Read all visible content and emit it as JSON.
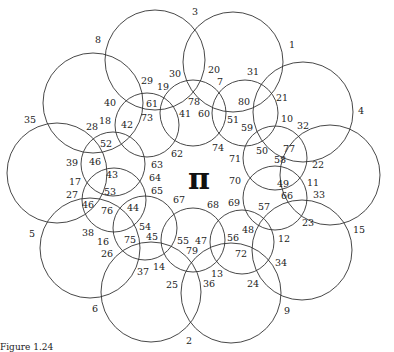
{
  "center_symbol": "π",
  "caption": "Figure 1.24",
  "outer_circles": [
    {
      "cx": 155,
      "cy": 60,
      "r": 50
    },
    {
      "cx": 233,
      "cy": 62,
      "r": 50
    },
    {
      "cx": 303,
      "cy": 112,
      "r": 50
    },
    {
      "cx": 330,
      "cy": 175,
      "r": 50
    },
    {
      "cx": 302,
      "cy": 250,
      "r": 50
    },
    {
      "cx": 231,
      "cy": 293,
      "r": 50
    },
    {
      "cx": 151,
      "cy": 292,
      "r": 50
    },
    {
      "cx": 90,
      "cy": 248,
      "r": 50
    },
    {
      "cx": 57,
      "cy": 173,
      "r": 50
    },
    {
      "cx": 93,
      "cy": 103,
      "r": 50
    }
  ],
  "inner_circles": [
    {
      "cx": 147,
      "cy": 125,
      "r": 32
    },
    {
      "cx": 193,
      "cy": 113,
      "r": 33
    },
    {
      "cx": 245,
      "cy": 113,
      "r": 33
    },
    {
      "cx": 275,
      "cy": 158,
      "r": 32
    },
    {
      "cx": 275,
      "cy": 198,
      "r": 32
    },
    {
      "cx": 242,
      "cy": 242,
      "r": 32
    },
    {
      "cx": 193,
      "cy": 240,
      "r": 32
    },
    {
      "cx": 145,
      "cy": 228,
      "r": 32
    },
    {
      "cx": 114,
      "cy": 200,
      "r": 32
    },
    {
      "cx": 113,
      "cy": 164,
      "r": 32
    }
  ],
  "labels": [
    {
      "t": "3",
      "x": 195,
      "y": 11
    },
    {
      "t": "1",
      "x": 292,
      "y": 44
    },
    {
      "t": "8",
      "x": 98,
      "y": 39
    },
    {
      "t": "4",
      "x": 361,
      "y": 110
    },
    {
      "t": "35",
      "x": 30,
      "y": 119
    },
    {
      "t": "15",
      "x": 359,
      "y": 229
    },
    {
      "t": "5",
      "x": 32,
      "y": 233
    },
    {
      "t": "6",
      "x": 95,
      "y": 308
    },
    {
      "t": "2",
      "x": 189,
      "y": 340
    },
    {
      "t": "9",
      "x": 287,
      "y": 310
    },
    {
      "t": "30",
      "x": 175,
      "y": 73
    },
    {
      "t": "20",
      "x": 214,
      "y": 69
    },
    {
      "t": "7",
      "x": 220,
      "y": 81
    },
    {
      "t": "31",
      "x": 253,
      "y": 71
    },
    {
      "t": "29",
      "x": 147,
      "y": 80
    },
    {
      "t": "19",
      "x": 163,
      "y": 86
    },
    {
      "t": "21",
      "x": 282,
      "y": 97
    },
    {
      "t": "40",
      "x": 110,
      "y": 102
    },
    {
      "t": "61",
      "x": 152,
      "y": 103
    },
    {
      "t": "78",
      "x": 194,
      "y": 101
    },
    {
      "t": "80",
      "x": 244,
      "y": 101
    },
    {
      "t": "73",
      "x": 147,
      "y": 117
    },
    {
      "t": "41",
      "x": 185,
      "y": 113
    },
    {
      "t": "60",
      "x": 204,
      "y": 113
    },
    {
      "t": "51",
      "x": 233,
      "y": 119
    },
    {
      "t": "10",
      "x": 287,
      "y": 118
    },
    {
      "t": "32",
      "x": 303,
      "y": 125
    },
    {
      "t": "18",
      "x": 105,
      "y": 120
    },
    {
      "t": "42",
      "x": 127,
      "y": 124
    },
    {
      "t": "28",
      "x": 92,
      "y": 126
    },
    {
      "t": "59",
      "x": 247,
      "y": 127
    },
    {
      "t": "52",
      "x": 106,
      "y": 143
    },
    {
      "t": "50",
      "x": 262,
      "y": 150
    },
    {
      "t": "77",
      "x": 289,
      "y": 148
    },
    {
      "t": "74",
      "x": 218,
      "y": 147
    },
    {
      "t": "62",
      "x": 177,
      "y": 153
    },
    {
      "t": "58",
      "x": 280,
      "y": 159
    },
    {
      "t": "22",
      "x": 318,
      "y": 164
    },
    {
      "t": "71",
      "x": 235,
      "y": 158
    },
    {
      "t": "39",
      "x": 72,
      "y": 162
    },
    {
      "t": "46",
      "x": 95,
      "y": 161
    },
    {
      "t": "63",
      "x": 157,
      "y": 164
    },
    {
      "t": "43",
      "x": 112,
      "y": 174
    },
    {
      "t": "64",
      "x": 155,
      "y": 177
    },
    {
      "t": "17",
      "x": 75,
      "y": 181
    },
    {
      "t": "49",
      "x": 283,
      "y": 183
    },
    {
      "t": "11",
      "x": 313,
      "y": 182
    },
    {
      "t": "70",
      "x": 235,
      "y": 180
    },
    {
      "t": "53",
      "x": 110,
      "y": 191
    },
    {
      "t": "65",
      "x": 157,
      "y": 190
    },
    {
      "t": "27",
      "x": 72,
      "y": 194
    },
    {
      "t": "66",
      "x": 287,
      "y": 195
    },
    {
      "t": "33",
      "x": 319,
      "y": 194
    },
    {
      "t": "67",
      "x": 179,
      "y": 199
    },
    {
      "t": "68",
      "x": 213,
      "y": 204
    },
    {
      "t": "69",
      "x": 234,
      "y": 202
    },
    {
      "t": "46",
      "x": 88,
      "y": 204
    },
    {
      "t": "76",
      "x": 107,
      "y": 210
    },
    {
      "t": "44",
      "x": 133,
      "y": 207
    },
    {
      "t": "57",
      "x": 264,
      "y": 206
    },
    {
      "t": "23",
      "x": 308,
      "y": 222
    },
    {
      "t": "38",
      "x": 88,
      "y": 232
    },
    {
      "t": "54",
      "x": 145,
      "y": 226
    },
    {
      "t": "48",
      "x": 248,
      "y": 229
    },
    {
      "t": "12",
      "x": 284,
      "y": 238
    },
    {
      "t": "16",
      "x": 103,
      "y": 241
    },
    {
      "t": "75",
      "x": 130,
      "y": 239
    },
    {
      "t": "45",
      "x": 152,
      "y": 236
    },
    {
      "t": "55",
      "x": 183,
      "y": 240
    },
    {
      "t": "47",
      "x": 201,
      "y": 240
    },
    {
      "t": "56",
      "x": 233,
      "y": 237
    },
    {
      "t": "26",
      "x": 107,
      "y": 253
    },
    {
      "t": "79",
      "x": 192,
      "y": 250
    },
    {
      "t": "72",
      "x": 241,
      "y": 253
    },
    {
      "t": "34",
      "x": 281,
      "y": 262
    },
    {
      "t": "14",
      "x": 159,
      "y": 266
    },
    {
      "t": "37",
      "x": 143,
      "y": 271
    },
    {
      "t": "13",
      "x": 217,
      "y": 273
    },
    {
      "t": "25",
      "x": 172,
      "y": 284
    },
    {
      "t": "36",
      "x": 209,
      "y": 283
    },
    {
      "t": "24",
      "x": 253,
      "y": 283
    }
  ]
}
